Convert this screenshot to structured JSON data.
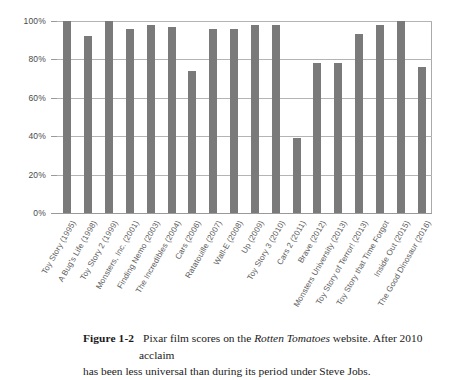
{
  "figure": {
    "number_label": "Figure 1-2",
    "caption_part1": "Pixar film scores on the ",
    "caption_italic": "Rotten Tomatoes",
    "caption_part2": " website. After 2010 acclaim",
    "caption_line2": "has been less universal than during its period under Steve Jobs."
  },
  "chart_data": {
    "type": "bar",
    "title": "",
    "xlabel": "",
    "ylabel": "",
    "ylim": [
      0,
      100
    ],
    "yticks": [
      0,
      20,
      40,
      60,
      80,
      100
    ],
    "ytick_labels": [
      "0%",
      "20%",
      "40%",
      "60%",
      "80%",
      "100%"
    ],
    "grid": true,
    "legend": "none",
    "bar_color": "#7a7a7a",
    "gridline_color": "#b4b4b4",
    "categories": [
      "Toy Story (1995)",
      "A Bug's Life (1998)",
      "Toy Story 2 (1999)",
      "Monsters, Inc. (2001)",
      "Finding Nemo (2003)",
      "The Incredibles (2004)",
      "Cars (2006)",
      "Ratatouille (2007)",
      "Wall-E (2008)",
      "Up (2009)",
      "Toy Story 3 (2010)",
      "Cars 2 (2011)",
      "Brave (2012)",
      "Monsters University (2013)",
      "Toy Story of Terror! (2013)",
      "Toy Story that Time Forgot",
      "Inside Out (2015)",
      "The Good Dinosaur (2016)"
    ],
    "values": [
      100,
      92,
      100,
      96,
      98,
      97,
      74,
      96,
      96,
      98,
      98,
      39,
      78,
      78,
      93,
      98,
      100,
      76
    ]
  }
}
